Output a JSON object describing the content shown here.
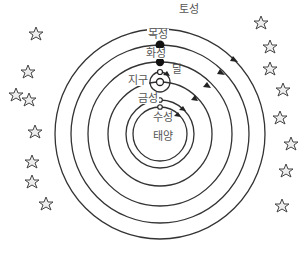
{
  "diagram": {
    "title": "",
    "center": {
      "x": 160,
      "y": 134
    },
    "colors": {
      "line": "#333333",
      "label": "#555555",
      "planet_filled": "#111111",
      "planet_hollow": "#ffffff",
      "star": "#444444"
    },
    "orbits": [
      {
        "name": "saturn-orbit",
        "r": 105
      },
      {
        "name": "jupiter-orbit",
        "r": 89
      },
      {
        "name": "mars-orbit",
        "r": 72
      },
      {
        "name": "earth-orbit",
        "r": 52
      },
      {
        "name": "venus-orbit",
        "r": 34
      },
      {
        "name": "mercury-orbit",
        "r": 27
      }
    ],
    "labels": {
      "saturn": "토성",
      "jupiter": "목성",
      "mars": "화성",
      "moon": "달",
      "earth": "지구",
      "venus": "금성",
      "mercury": "수성",
      "sun": "태양"
    }
  }
}
